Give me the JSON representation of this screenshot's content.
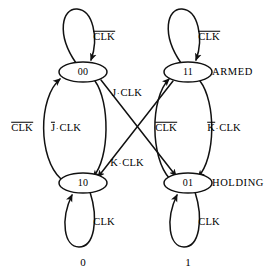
{
  "diagram": {
    "type": "state-transition-diagram",
    "background_color": "#ffffff",
    "stroke_color": "#000000",
    "states": [
      {
        "id": "s00",
        "label": "00",
        "cx": 83,
        "cy": 72,
        "rx": 24,
        "ry": 10,
        "row": "top",
        "column": "left"
      },
      {
        "id": "s11",
        "label": "11",
        "cx": 188,
        "cy": 72,
        "rx": 24,
        "ry": 10,
        "row": "top",
        "column": "right"
      },
      {
        "id": "s10",
        "label": "10",
        "cx": 83,
        "cy": 183,
        "rx": 24,
        "ry": 10,
        "row": "bottom",
        "column": "left"
      },
      {
        "id": "s01",
        "label": "01",
        "cx": 188,
        "cy": 183,
        "rx": 24,
        "ry": 10,
        "row": "bottom",
        "column": "right"
      }
    ],
    "row_labels": [
      {
        "id": "armed",
        "text": "ARMED",
        "x": 212,
        "y": 72
      },
      {
        "id": "holding",
        "text": "HOLDING",
        "x": 212,
        "y": 183
      }
    ],
    "column_labels": [
      {
        "id": "col-0",
        "text": "0",
        "x": 83,
        "y": 262
      },
      {
        "id": "col-1",
        "text": "1",
        "x": 188,
        "y": 262
      }
    ],
    "transitions": [
      {
        "id": "t-00-self",
        "from": "00",
        "to": "00",
        "kind": "self-loop-up",
        "label_parts": [
          {
            "text": "CLK",
            "overline": true
          }
        ],
        "label_x": 104,
        "label_y": 37
      },
      {
        "id": "t-11-self",
        "from": "11",
        "to": "11",
        "kind": "self-loop-up",
        "label_parts": [
          {
            "text": "CLK",
            "overline": true
          }
        ],
        "label_x": 209,
        "label_y": 37
      },
      {
        "id": "t-10-self",
        "from": "10",
        "to": "10",
        "kind": "self-loop-down",
        "label_parts": [
          {
            "text": "CLK",
            "overline": false
          }
        ],
        "label_x": 104,
        "label_y": 222
      },
      {
        "id": "t-01-self",
        "from": "01",
        "to": "01",
        "kind": "self-loop-down",
        "label_parts": [
          {
            "text": "CLK",
            "overline": false
          }
        ],
        "label_x": 209,
        "label_y": 222
      },
      {
        "id": "t-10-00",
        "from": "10",
        "to": "00",
        "kind": "curve-left-up",
        "label_parts": [
          {
            "text": "CLK",
            "overline": true
          }
        ],
        "label_x": 22,
        "label_y": 128
      },
      {
        "id": "t-00-10",
        "from": "00",
        "to": "10",
        "kind": "curve-left-down",
        "label_parts": [
          {
            "text": "J",
            "overline": true
          },
          {
            "text": "·"
          },
          {
            "text": "CLK",
            "overline": false
          }
        ],
        "label_x": 66,
        "label_y": 128
      },
      {
        "id": "t-01-11",
        "from": "01",
        "to": "11",
        "kind": "curve-right-up",
        "label_parts": [
          {
            "text": "CLK",
            "overline": true
          }
        ],
        "label_x": 166,
        "label_y": 128
      },
      {
        "id": "t-11-01",
        "from": "11",
        "to": "01",
        "kind": "curve-right-down",
        "label_parts": [
          {
            "text": "K",
            "overline": true
          },
          {
            "text": "·"
          },
          {
            "text": "CLK",
            "overline": false
          }
        ],
        "label_x": 224,
        "label_y": 128
      },
      {
        "id": "t-00-01",
        "from": "00",
        "to": "01",
        "kind": "diagonal-down-right",
        "label_parts": [
          {
            "text": "J",
            "overline": false
          },
          {
            "text": "·"
          },
          {
            "text": "CLK",
            "overline": false
          }
        ],
        "label_x": 127,
        "label_y": 93
      },
      {
        "id": "t-11-10",
        "from": "11",
        "to": "10",
        "kind": "diagonal-down-left",
        "label_parts": [
          {
            "text": "K",
            "overline": false
          },
          {
            "text": "·"
          },
          {
            "text": "CLK",
            "overline": false
          }
        ],
        "label_x": 127,
        "label_y": 163
      }
    ]
  }
}
